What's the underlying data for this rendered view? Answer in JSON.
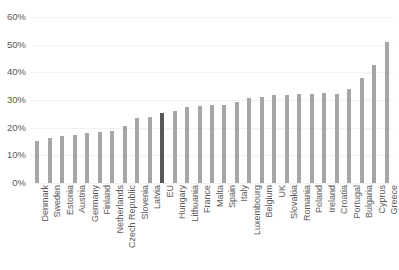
{
  "chart_data": {
    "type": "bar",
    "title": "",
    "subtitle": "",
    "xlabel": "",
    "ylabel": "",
    "ylim": [
      0,
      60
    ],
    "ytick_labels": [
      "0%",
      "10%",
      "20%",
      "30%",
      "40%",
      "50%",
      "60%"
    ],
    "ytick_values": [
      0,
      10,
      20,
      30,
      40,
      50,
      60
    ],
    "grid": true,
    "legend": "none",
    "value_suffix": "%",
    "categories": [
      "Denmark",
      "Sweden",
      "Estonia",
      "Austria",
      "Germany",
      "Finland",
      "Netherlands",
      "Czech Republic",
      "Slovenia",
      "Latvia",
      "EU",
      "Hungary",
      "Lithuania",
      "France",
      "Malta",
      "Spain",
      "Italy",
      "Luxembourg",
      "Belgium",
      "UK",
      "Slovakia",
      "Romania",
      "Poland",
      "Ireland",
      "Croatia",
      "Portugal",
      "Bulgaria",
      "Cyprus",
      "Greece"
    ],
    "values": [
      15.3,
      16.2,
      16.9,
      17.5,
      18.0,
      18.4,
      18.8,
      20.5,
      23.5,
      24.0,
      25.3,
      26.0,
      27.4,
      27.8,
      28.1,
      28.1,
      29.2,
      30.6,
      31.1,
      31.7,
      31.8,
      32.2,
      32.3,
      32.4,
      32.3,
      34.0,
      37.8,
      42.6,
      51.0
    ],
    "highlight_category": "EU",
    "colors": {
      "bar": "#a6a6a6",
      "bar_highlight": "#595959",
      "gridline": "#f2f2f2",
      "text": "#595959",
      "background": "#ffffff"
    }
  }
}
